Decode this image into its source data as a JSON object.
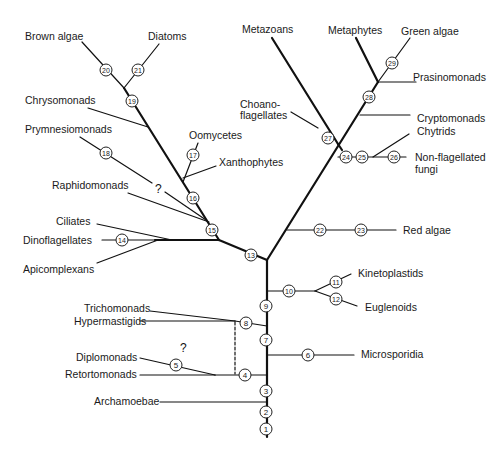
{
  "diagram": {
    "type": "phylogenetic-tree",
    "taxa": {
      "brown_algae": "Brown algae",
      "diatoms": "Diatoms",
      "chrysomonads": "Chrysomonads",
      "prymnesiomonads": "Prymnesiomonads",
      "oomycetes": "Oomycetes",
      "xanthophytes": "Xanthophytes",
      "raphidomonads": "Raphidomonads",
      "ciliates": "Ciliates",
      "dinoflagellates": "Dinoflagellates",
      "apicomplexans": "Apicomplexans",
      "metazoans": "Metazoans",
      "metaphytes": "Metaphytes",
      "green_algae": "Green algae",
      "prasinomonads": "Prasinomonads",
      "choanoflagellates_1": "Choano-",
      "choanoflagellates_2": "flagellates",
      "cryptomonads": "Cryptomonads",
      "chytrids": "Chytrids",
      "nonflag_1": "Non-flagellated",
      "nonflag_2": "fungi",
      "red_algae": "Red algae",
      "kinetoplastids": "Kinetoplastids",
      "euglenoids": "Euglenoids",
      "trichomonads": "Trichomonads",
      "hypermastigids": "Hypermastigids",
      "microsporidia": "Microsporidia",
      "diplomonads": "Diplomonads",
      "retortomonads": "Retortomonads",
      "archamoebae": "Archamoebae"
    },
    "uncertain_marks": [
      "?",
      "?"
    ],
    "nodes": [
      {
        "id": "1",
        "x": 266,
        "y": 429
      },
      {
        "id": "2",
        "x": 266,
        "y": 412
      },
      {
        "id": "3",
        "x": 266,
        "y": 391
      },
      {
        "id": "4",
        "x": 245,
        "y": 375
      },
      {
        "id": "5",
        "x": 176,
        "y": 365
      },
      {
        "id": "6",
        "x": 308,
        "y": 355
      },
      {
        "id": "7",
        "x": 266,
        "y": 340
      },
      {
        "id": "8",
        "x": 246,
        "y": 323
      },
      {
        "id": "9",
        "x": 266,
        "y": 306
      },
      {
        "id": "10",
        "x": 289,
        "y": 291
      },
      {
        "id": "11",
        "x": 336,
        "y": 282
      },
      {
        "id": "12",
        "x": 336,
        "y": 299
      },
      {
        "id": "13",
        "x": 251,
        "y": 255
      },
      {
        "id": "14",
        "x": 122,
        "y": 240
      },
      {
        "id": "15",
        "x": 212,
        "y": 230
      },
      {
        "id": "16",
        "x": 193,
        "y": 198
      },
      {
        "id": "17",
        "x": 193,
        "y": 155
      },
      {
        "id": "18",
        "x": 106,
        "y": 153
      },
      {
        "id": "19",
        "x": 132,
        "y": 101
      },
      {
        "id": "20",
        "x": 106,
        "y": 70
      },
      {
        "id": "21",
        "x": 138,
        "y": 70
      },
      {
        "id": "22",
        "x": 320,
        "y": 230
      },
      {
        "id": "23",
        "x": 361,
        "y": 230
      },
      {
        "id": "24",
        "x": 346,
        "y": 157
      },
      {
        "id": "25",
        "x": 362,
        "y": 157
      },
      {
        "id": "26",
        "x": 394,
        "y": 157
      },
      {
        "id": "27",
        "x": 328,
        "y": 138
      },
      {
        "id": "28",
        "x": 369,
        "y": 97
      },
      {
        "id": "29",
        "x": 392,
        "y": 63
      }
    ]
  },
  "colors": {
    "line": "#111111",
    "node_fill": "#ffffff",
    "node_stroke": "#222222",
    "text": "#1a1a1a"
  }
}
